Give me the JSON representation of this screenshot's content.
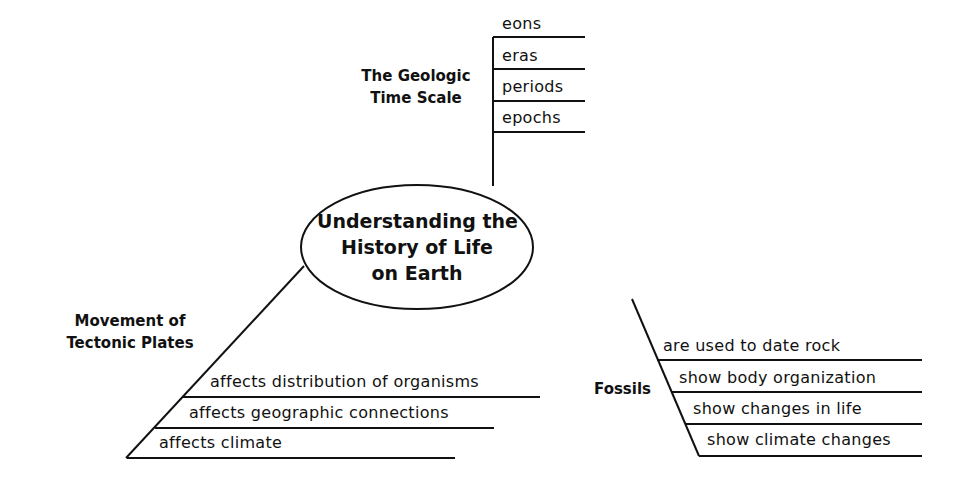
{
  "center": {
    "lines": [
      "Understanding the",
      "History of Life",
      "on Earth"
    ]
  },
  "branches": {
    "geologic": {
      "title_lines": [
        "The Geologic",
        "Time Scale"
      ],
      "items": [
        "eons",
        "eras",
        "periods",
        "epochs"
      ]
    },
    "tectonic": {
      "title_lines": [
        "Movement of",
        "Tectonic Plates"
      ],
      "items": [
        "affects distribution of organisms",
        "affects geographic connections",
        "affects climate"
      ]
    },
    "fossils": {
      "title": "Fossils",
      "items": [
        "are used to date rock",
        "show body organization",
        "show changes in life",
        "show climate changes"
      ]
    }
  },
  "colors": {
    "line": "#111111",
    "background": "#ffffff"
  }
}
